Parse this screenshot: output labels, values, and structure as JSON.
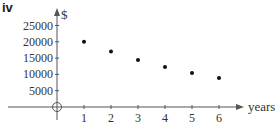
{
  "panel_label": "iv",
  "chart_data": {
    "type": "scatter",
    "title": "",
    "xlabel": "years",
    "ylabel": "$",
    "x": [
      1,
      2,
      3,
      4,
      5,
      6
    ],
    "values": [
      20000,
      17000,
      14450,
      12283,
      10440,
      8874
    ],
    "x_ticks": [
      "1",
      "2",
      "3",
      "4",
      "5",
      "6"
    ],
    "y_ticks": [
      "25000",
      "20000",
      "15000",
      "10000",
      "5000"
    ],
    "origin_label": "O",
    "xlim": [
      0,
      6.8
    ],
    "ylim": [
      0,
      30000
    ],
    "grid": false,
    "legend": null
  },
  "colors": {
    "axis": "#555555",
    "points": "#111111",
    "text": "#333333"
  }
}
